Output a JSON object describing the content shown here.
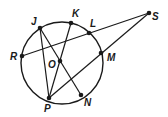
{
  "diagram": {
    "type": "geometry-circle",
    "circle": {
      "center": "O",
      "cx": 62,
      "cy": 63,
      "r": 41
    },
    "stroke_color": "#1a1a1a",
    "points": [
      {
        "name": "J",
        "x": 40,
        "y": 28,
        "lx": 31,
        "ly": 25
      },
      {
        "name": "K",
        "x": 71,
        "y": 23,
        "lx": 72,
        "ly": 17
      },
      {
        "name": "L",
        "x": 89,
        "y": 33,
        "lx": 90,
        "ly": 27
      },
      {
        "name": "S",
        "x": 149,
        "y": 13,
        "lx": 152,
        "ly": 20
      },
      {
        "name": "R",
        "x": 22,
        "y": 56,
        "lx": 10,
        "ly": 60
      },
      {
        "name": "O",
        "x": 60,
        "y": 61,
        "lx": 48,
        "ly": 68
      },
      {
        "name": "M",
        "x": 101,
        "y": 53,
        "lx": 107,
        "ly": 61
      },
      {
        "name": "P",
        "x": 49,
        "y": 98,
        "lx": 44,
        "ly": 112
      },
      {
        "name": "N",
        "x": 81,
        "y": 95,
        "lx": 84,
        "ly": 106
      }
    ],
    "segments": [
      {
        "from": "J",
        "to": "P"
      },
      {
        "from": "J",
        "to": "N"
      },
      {
        "from": "K",
        "to": "P"
      },
      {
        "from": "R",
        "to": "S"
      },
      {
        "from": "P",
        "to": "S"
      }
    ],
    "labels": {
      "J": "J",
      "K": "K",
      "L": "L",
      "S": "S",
      "R": "R",
      "O": "O",
      "M": "M",
      "P": "P",
      "N": "N"
    }
  }
}
